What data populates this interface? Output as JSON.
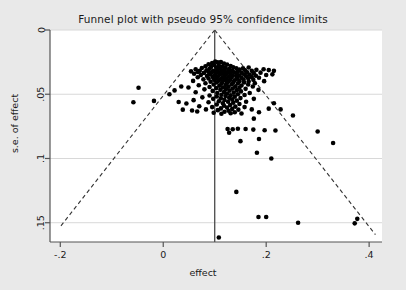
{
  "chart_data": {
    "type": "scatter",
    "title": "Funnel plot with pseudo 95% confidence limits",
    "xlabel": "effect",
    "ylabel": "s.e. of effect",
    "xlim": [
      -0.22,
      0.425
    ],
    "ylim": [
      0.165,
      0.0
    ],
    "y_inverted": true,
    "grid": "horizontal",
    "legend": null,
    "xticks": [
      -0.2,
      0,
      0.2,
      0.4
    ],
    "xtick_labels": [
      "-.2",
      "0",
      ".2",
      ".4"
    ],
    "yticks": [
      0,
      0.05,
      0.1,
      0.15
    ],
    "ytick_labels": [
      "0",
      ".05",
      ".1",
      ".15"
    ],
    "annotations": [
      {
        "name": "pooled-effect-line",
        "type": "vline",
        "x": 0.1
      },
      {
        "name": "pseudo-95-ci-left",
        "type": "line",
        "style": "dashed",
        "from": [
          0.1,
          0
        ],
        "to": [
          -0.2,
          0.1531
        ]
      },
      {
        "name": "pseudo-95-ci-right",
        "type": "line",
        "style": "dashed",
        "from": [
          0.1,
          0
        ],
        "to": [
          0.4122,
          0.1593
        ]
      }
    ],
    "marker": {
      "shape": "circle",
      "color": "#000000",
      "size": 4.6
    },
    "points": [
      [
        0.101,
        0.0245
      ],
      [
        0.106,
        0.0252
      ],
      [
        0.112,
        0.025
      ],
      [
        0.095,
        0.0258
      ],
      [
        0.118,
        0.0262
      ],
      [
        0.088,
        0.0266
      ],
      [
        0.124,
        0.0268
      ],
      [
        0.099,
        0.0272
      ],
      [
        0.108,
        0.0276
      ],
      [
        0.131,
        0.028
      ],
      [
        0.082,
        0.0282
      ],
      [
        0.115,
        0.0285
      ],
      [
        0.093,
        0.0288
      ],
      [
        0.136,
        0.029
      ],
      [
        0.103,
        0.0292
      ],
      [
        0.121,
        0.0295
      ],
      [
        0.075,
        0.0296
      ],
      [
        0.142,
        0.0298
      ],
      [
        0.11,
        0.03
      ],
      [
        0.09,
        0.0302
      ],
      [
        0.128,
        0.0304
      ],
      [
        0.155,
        0.0298
      ],
      [
        0.166,
        0.0292
      ],
      [
        0.063,
        0.0305
      ],
      [
        0.148,
        0.0308
      ],
      [
        0.105,
        0.031
      ],
      [
        0.118,
        0.0312
      ],
      [
        0.084,
        0.0314
      ],
      [
        0.134,
        0.0316
      ],
      [
        0.097,
        0.0318
      ],
      [
        0.159,
        0.0314
      ],
      [
        0.071,
        0.0318
      ],
      [
        0.113,
        0.032
      ],
      [
        0.126,
        0.0322
      ],
      [
        0.145,
        0.0322
      ],
      [
        0.101,
        0.0325
      ],
      [
        0.088,
        0.0326
      ],
      [
        0.172,
        0.0318
      ],
      [
        0.181,
        0.031
      ],
      [
        0.195,
        0.0305
      ],
      [
        0.205,
        0.0312
      ],
      [
        0.215,
        0.0318
      ],
      [
        0.054,
        0.0322
      ],
      [
        0.067,
        0.0326
      ],
      [
        0.12,
        0.0328
      ],
      [
        0.108,
        0.033
      ],
      [
        0.138,
        0.033
      ],
      [
        0.094,
        0.0332
      ],
      [
        0.152,
        0.0332
      ],
      [
        0.163,
        0.033
      ],
      [
        0.079,
        0.0334
      ],
      [
        0.13,
        0.0336
      ],
      [
        0.114,
        0.0338
      ],
      [
        0.102,
        0.034
      ],
      [
        0.176,
        0.0336
      ],
      [
        0.189,
        0.0332
      ],
      [
        0.06,
        0.034
      ],
      [
        0.143,
        0.0342
      ],
      [
        0.122,
        0.0344
      ],
      [
        0.091,
        0.0346
      ],
      [
        0.157,
        0.0344
      ],
      [
        0.11,
        0.0348
      ],
      [
        0.168,
        0.0348
      ],
      [
        0.073,
        0.035
      ],
      [
        0.135,
        0.0352
      ],
      [
        0.1,
        0.0354
      ],
      [
        0.148,
        0.0354
      ],
      [
        0.119,
        0.0356
      ],
      [
        0.085,
        0.0358
      ],
      [
        0.18,
        0.0356
      ],
      [
        0.2,
        0.035
      ],
      [
        0.212,
        0.0345
      ],
      [
        0.128,
        0.036
      ],
      [
        0.106,
        0.0362
      ],
      [
        0.161,
        0.036
      ],
      [
        0.142,
        0.0364
      ],
      [
        0.096,
        0.0366
      ],
      [
        0.116,
        0.0368
      ],
      [
        0.172,
        0.0366
      ],
      [
        0.067,
        0.0368
      ],
      [
        0.133,
        0.037
      ],
      [
        0.152,
        0.0372
      ],
      [
        0.104,
        0.0374
      ],
      [
        0.123,
        0.0376
      ],
      [
        0.088,
        0.0378
      ],
      [
        0.165,
        0.0376
      ],
      [
        0.186,
        0.0372
      ],
      [
        0.144,
        0.038
      ],
      [
        0.112,
        0.0382
      ],
      [
        0.078,
        0.0384
      ],
      [
        0.13,
        0.0386
      ],
      [
        0.156,
        0.0386
      ],
      [
        0.099,
        0.0388
      ],
      [
        0.12,
        0.039
      ],
      [
        0.175,
        0.0388
      ],
      [
        0.139,
        0.0392
      ],
      [
        0.108,
        0.0394
      ],
      [
        0.058,
        0.0396
      ],
      [
        0.148,
        0.0398
      ],
      [
        0.127,
        0.04
      ],
      [
        0.092,
        0.0402
      ],
      [
        0.166,
        0.04
      ],
      [
        0.115,
        0.0404
      ],
      [
        0.196,
        0.0398
      ],
      [
        0.136,
        0.0406
      ],
      [
        0.104,
        0.0408
      ],
      [
        0.157,
        0.0408
      ],
      [
        0.124,
        0.0412
      ],
      [
        0.082,
        0.0414
      ],
      [
        0.145,
        0.0416
      ],
      [
        0.113,
        0.0418
      ],
      [
        0.178,
        0.0414
      ],
      [
        0.133,
        0.0422
      ],
      [
        0.098,
        0.0424
      ],
      [
        0.165,
        0.0424
      ],
      [
        0.121,
        0.0428
      ],
      [
        0.069,
        0.043
      ],
      [
        0.152,
        0.0432
      ],
      [
        0.109,
        0.0434
      ],
      [
        0.14,
        0.0438
      ],
      [
        0.127,
        0.0442
      ],
      [
        0.09,
        0.0444
      ],
      [
        0.174,
        0.044
      ],
      [
        0.116,
        0.0448
      ],
      [
        0.148,
        0.045
      ],
      [
        0.103,
        0.0452
      ],
      [
        0.035,
        0.044
      ],
      [
        0.049,
        0.0448
      ],
      [
        0.135,
        0.0456
      ],
      [
        0.122,
        0.046
      ],
      [
        0.16,
        0.0458
      ],
      [
        0.08,
        0.0462
      ],
      [
        0.111,
        0.0466
      ],
      [
        0.143,
        0.0468
      ],
      [
        0.129,
        0.0472
      ],
      [
        0.096,
        0.0474
      ],
      [
        0.185,
        0.0466
      ],
      [
        0.151,
        0.0478
      ],
      [
        0.118,
        0.0482
      ],
      [
        0.063,
        0.0484
      ],
      [
        0.137,
        0.0488
      ],
      [
        0.105,
        0.049
      ],
      [
        0.124,
        0.0494
      ],
      [
        0.168,
        0.049
      ],
      [
        -0.048,
        0.045
      ],
      [
        0.022,
        0.047
      ],
      [
        0.012,
        0.05
      ],
      [
        0.145,
        0.05
      ],
      [
        0.113,
        0.0504
      ],
      [
        0.131,
        0.0508
      ],
      [
        0.09,
        0.051
      ],
      [
        0.158,
        0.0506
      ],
      [
        0.121,
        0.0514
      ],
      [
        0.104,
        0.0518
      ],
      [
        0.139,
        0.052
      ],
      [
        0.076,
        0.0524
      ],
      [
        0.128,
        0.0528
      ],
      [
        0.112,
        0.0532
      ],
      [
        0.15,
        0.053
      ],
      [
        0.097,
        0.0536
      ],
      [
        0.134,
        0.054
      ],
      [
        0.119,
        0.0544
      ],
      [
        0.176,
        0.0536
      ],
      [
        0.059,
        0.0546
      ],
      [
        0.143,
        0.055
      ],
      [
        0.108,
        0.0554
      ],
      [
        0.126,
        0.0558
      ],
      [
        0.088,
        0.0562
      ],
      [
        0.161,
        0.0558
      ],
      [
        0.136,
        0.0566
      ],
      [
        0.116,
        0.057
      ],
      [
        -0.058,
        0.0562
      ],
      [
        -0.018,
        0.0552
      ],
      [
        0.03,
        0.056
      ],
      [
        0.045,
        0.0572
      ],
      [
        0.148,
        0.0576
      ],
      [
        0.104,
        0.058
      ],
      [
        0.13,
        0.0584
      ],
      [
        0.118,
        0.059
      ],
      [
        0.07,
        0.0594
      ],
      [
        0.14,
        0.0596
      ],
      [
        0.095,
        0.06
      ],
      [
        0.124,
        0.0604
      ],
      [
        0.158,
        0.06
      ],
      [
        0.112,
        0.061
      ],
      [
        0.134,
        0.0614
      ],
      [
        0.083,
        0.0618
      ],
      [
        0.146,
        0.062
      ],
      [
        0.106,
        0.0624
      ],
      [
        0.127,
        0.0628
      ],
      [
        0.172,
        0.0618
      ],
      [
        0.038,
        0.062
      ],
      [
        0.056,
        0.0626
      ],
      [
        0.066,
        0.0634
      ],
      [
        0.119,
        0.0636
      ],
      [
        0.139,
        0.064
      ],
      [
        0.098,
        0.0644
      ],
      [
        0.131,
        0.0648
      ],
      [
        0.113,
        0.0652
      ],
      [
        0.152,
        0.065
      ],
      [
        0.186,
        0.064
      ],
      [
        0.205,
        0.0612
      ],
      [
        0.215,
        0.057
      ],
      [
        0.228,
        0.0618
      ],
      [
        0.252,
        0.0665
      ],
      [
        0.176,
        0.069
      ],
      [
        0.125,
        0.077
      ],
      [
        0.135,
        0.0772
      ],
      [
        0.145,
        0.0768
      ],
      [
        0.16,
        0.077
      ],
      [
        0.175,
        0.0775
      ],
      [
        0.128,
        0.08
      ],
      [
        0.197,
        0.078
      ],
      [
        0.218,
        0.0782
      ],
      [
        0.3,
        0.079
      ],
      [
        0.15,
        0.0865
      ],
      [
        0.186,
        0.0848
      ],
      [
        0.33,
        0.088
      ],
      [
        0.182,
        0.0955
      ],
      [
        0.21,
        0.1
      ],
      [
        0.142,
        0.126
      ],
      [
        0.185,
        0.1455
      ],
      [
        0.2,
        0.1455
      ],
      [
        0.377,
        0.147
      ],
      [
        0.262,
        0.15
      ],
      [
        0.372,
        0.1505
      ],
      [
        0.108,
        0.1615
      ]
    ]
  },
  "colors": {
    "background": "#e9e9e9",
    "plot_background": "#ffffff",
    "axis": "#555555",
    "grid": "#d8d8d8",
    "marker": "#000000",
    "ci_line": "#333333",
    "text": "#1a1a1a"
  }
}
